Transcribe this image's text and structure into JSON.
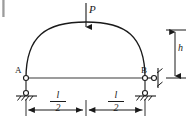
{
  "figure": {
    "labels": {
      "load": "P",
      "height": "h",
      "support_left": "A",
      "support_right": "B"
    },
    "dimensions": [
      {
        "name": "half-span-left",
        "numerator": "l",
        "denominator": "2"
      },
      {
        "name": "half-span-right",
        "numerator": "l",
        "denominator": "2"
      }
    ],
    "colors": {
      "line": "#1a1a1a",
      "background": "#ffffff",
      "tie": "#3a3a3a"
    },
    "geometry": {
      "span_px": 119,
      "rise_px": 49,
      "apex_x": 86,
      "apex_y": 29,
      "springing_left_x": 26,
      "springing_right_x": 145,
      "tie_y": 78,
      "dimension_line_y": 110,
      "height_arrow_x": 175
    }
  }
}
